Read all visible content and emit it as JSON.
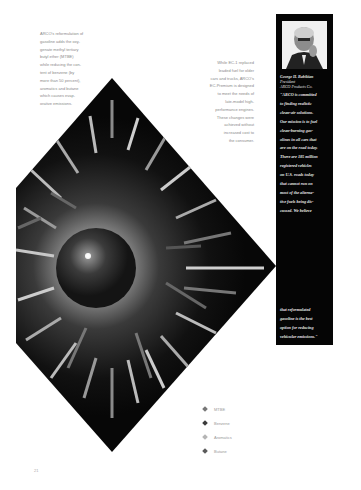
{
  "page": {
    "number": "21"
  },
  "intro_left": {
    "lines": [
      "ARCO's reformulation of",
      "gasoline adds the oxy-",
      "genate methyl tertiary",
      "butyl ether (MTBE)",
      "while reducing the con-",
      "tent of benzene (by",
      "more than 50 percent),",
      "aromatics and butane",
      "which causes evap-",
      "orative emissions."
    ]
  },
  "intro_right": {
    "lines": [
      "While EC-1 replaced",
      "leaded fuel for older",
      "cars and trucks, ARCO's",
      "EC-Premium is designed",
      "to meet the needs of",
      "late-model high-",
      "performance engines.",
      "These changes were",
      "achieved without",
      "increased cost to",
      "the consumer."
    ]
  },
  "sidebar": {
    "portrait_alt": "Portrait of George H. Babikian",
    "person_name": "George H. Babikian",
    "person_title": "President",
    "person_company": "ARCO Products Co.",
    "quote_lines": [
      "\"ARCO is committed",
      "to finding realistic",
      "clean-air solutions.",
      "Our mission is to fuel",
      "clean-burning gas-",
      "olines in all cars that",
      "are on the road today.",
      "There are 185 million",
      "registered vehicles",
      "on U.S. roads today",
      "that cannot run on",
      "most of the alterna-",
      "tive fuels being dis-",
      "cussed. We believe"
    ],
    "quote_end_lines": [
      "that reformulated",
      "gasoline is the best",
      "option for reducing",
      "vehicular emissions.\""
    ]
  },
  "illustration": {
    "description": "Diamond-shaped illustration of a dark sphere with arrows radiating outward",
    "background_color": "#0a0a0a",
    "glow_color": "#bdbdbd",
    "sphere_color": "#2b2b2b"
  },
  "legend": {
    "items": [
      {
        "label": "MTBE",
        "color": "#777777"
      },
      {
        "label": "Benzene",
        "color": "#3a3a3a"
      },
      {
        "label": "Aromatics",
        "color": "#b5b5b5"
      },
      {
        "label": "Butane",
        "color": "#5a5a5a"
      }
    ]
  }
}
